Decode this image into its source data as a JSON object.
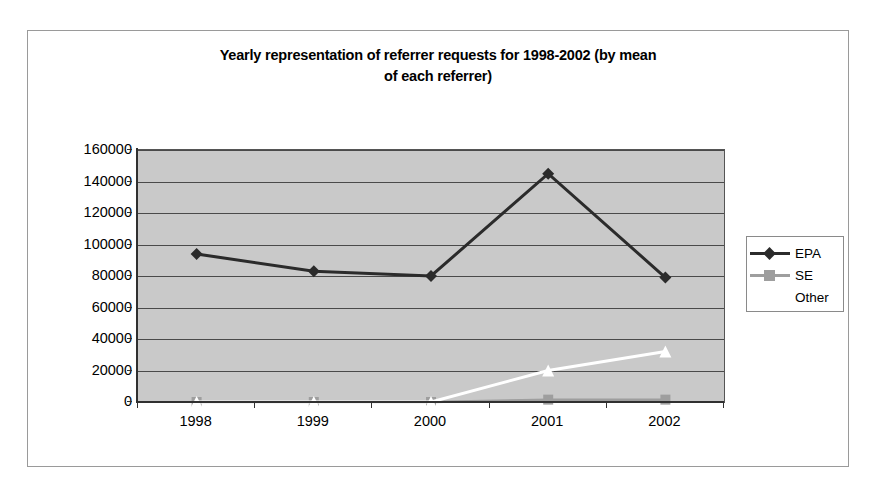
{
  "chart_data": {
    "type": "line",
    "title": "Yearly representation of referrer requests for 1998-2002 (by mean of each referrer)",
    "title_line1": "Yearly representation of referrer requests for 1998-2002 (by mean",
    "title_line2": "of each referrer)",
    "xlabel": "",
    "ylabel": "",
    "categories": [
      "1998",
      "1999",
      "2000",
      "2001",
      "2002"
    ],
    "ylim": [
      0,
      160000
    ],
    "y_ticks": [
      0,
      20000,
      40000,
      60000,
      80000,
      100000,
      120000,
      140000,
      160000
    ],
    "y_tick_labels": [
      "0",
      "20000",
      "40000",
      "60000",
      "80000",
      "100000",
      "120000",
      "140000",
      "160000"
    ],
    "grid": true,
    "legend_position": "right",
    "plot_background": "#c9c9c9",
    "series": [
      {
        "name": "EPA",
        "color": "#2b2b2b",
        "marker": "diamond",
        "values": [
          94000,
          83000,
          80000,
          145000,
          79000
        ]
      },
      {
        "name": "SE",
        "color": "#9e9e9e",
        "marker": "square",
        "values": [
          0,
          0,
          0,
          1500,
          1500
        ]
      },
      {
        "name": "Other",
        "color": "#ffffff",
        "marker": "triangle",
        "values": [
          0,
          0,
          0,
          20000,
          32000
        ]
      }
    ]
  },
  "legend": {
    "entries": [
      {
        "label": "EPA"
      },
      {
        "label": "SE"
      },
      {
        "label": "Other"
      }
    ]
  }
}
